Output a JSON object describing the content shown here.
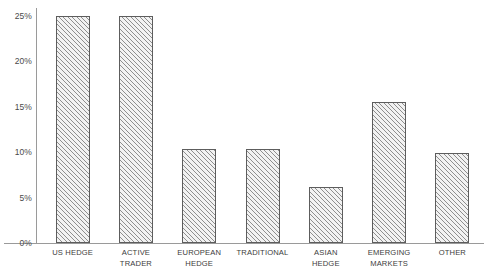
{
  "chart_data": {
    "type": "bar",
    "title": "",
    "subtitle": "",
    "xlabel": "",
    "ylabel": "",
    "ylim": [
      0,
      25
    ],
    "grid": false,
    "legend": false,
    "categories": [
      "US HEDGE",
      "ACTIVE\nTRADER",
      "EUROPEAN\nHEDGE",
      "TRADITIONAL",
      "ASIAN\nHEDGE",
      "EMERGING\nMARKETS",
      "OTHER"
    ],
    "values": [
      25.0,
      25.0,
      10.3,
      10.3,
      6.2,
      15.5,
      9.9
    ],
    "ytick_labels": [
      "0%",
      "5%",
      "10%",
      "15%",
      "20%",
      "25%"
    ],
    "ytick_values": [
      0,
      5,
      10,
      15,
      20,
      25
    ],
    "bar_fill": "#f2f2f2",
    "bar_hatch": "diagonal-forward-slash",
    "bar_hatch_color": "#8e8e8e",
    "bar_border": "#5d5d5d",
    "axis_color": "#9a9a9a",
    "label_color": "#3c3c3c",
    "tick_label_color": "#4a4a4a",
    "background": "#ffffff"
  }
}
